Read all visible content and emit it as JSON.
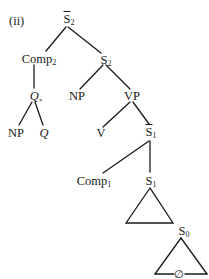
{
  "example_label": "(ii)",
  "nodes": {
    "root": {
      "base": "S",
      "sub": "2",
      "bar": true
    },
    "comp2": {
      "base": "Comp",
      "sub": "2"
    },
    "s2": {
      "base": "S",
      "sub": "2"
    },
    "q_star": {
      "base": "Q",
      "sub": "*",
      "italic": true
    },
    "np_upper": {
      "base": "NP"
    },
    "vp": {
      "base": "VP"
    },
    "np_lower": {
      "base": "NP"
    },
    "q_lower": {
      "base": "Q",
      "italic": true
    },
    "v": {
      "base": "V"
    },
    "s1_bar": {
      "base": "S",
      "sub": "1",
      "bar": true
    },
    "comp1": {
      "base": "Comp",
      "sub": "1"
    },
    "s1": {
      "base": "S",
      "sub": "1"
    },
    "s0": {
      "base": "S",
      "sub": "0"
    },
    "empty": {
      "base": "∅"
    }
  },
  "colors": {
    "ink": "#1a1a1a",
    "background": "#ffffff"
  }
}
